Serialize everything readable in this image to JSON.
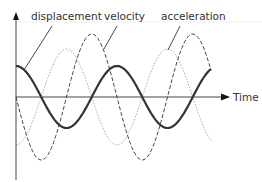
{
  "chart_data": {
    "type": "line",
    "title": "",
    "xlabel": "Time",
    "ylabel": "",
    "grid": false,
    "legend": "callout labels at top with leader lines",
    "series": [
      {
        "name": "displacement",
        "style": "solid",
        "color": "#333333",
        "width": 2.2,
        "amplitude": 31,
        "phase": "cos",
        "leader": {
          "x1": 24,
          "y1": 70,
          "x2": 52,
          "y2": 26
        }
      },
      {
        "name": "velocity",
        "style": "dashed",
        "color": "#444444",
        "width": 1,
        "amplitude": 63,
        "phase": "-sin",
        "leader": {
          "x1": 104,
          "y1": 49,
          "x2": 117,
          "y2": 26
        }
      },
      {
        "name": "acceleration",
        "style": "dotted",
        "color": "#aaaaaa",
        "width": 1,
        "amplitude": 48,
        "phase": "-cos",
        "leader": {
          "x1": 168,
          "y1": 50,
          "x2": 180,
          "y2": 26
        }
      }
    ],
    "axes": {
      "origin_x": 16,
      "zero_y": 97,
      "y_top": 12,
      "y_bottom": 180,
      "x_end": 228,
      "period_px": 101,
      "curve_x_start": 16,
      "curve_x_end": 211
    }
  },
  "labels": {
    "displacement": "displacement",
    "velocity": "velocity",
    "acceleration": "acceleration",
    "time": "Time"
  }
}
